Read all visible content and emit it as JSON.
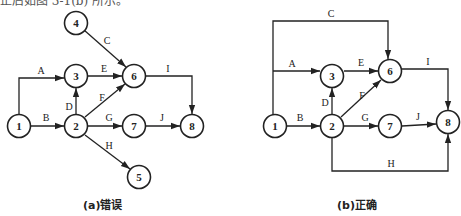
{
  "top_text": "正后如图 3-1(b) 所示。",
  "diagrams": [
    {
      "caption": "(a)错误",
      "nodes": [
        {
          "id": "1",
          "label": "1"
        },
        {
          "id": "2",
          "label": "2"
        },
        {
          "id": "3",
          "label": "3"
        },
        {
          "id": "4",
          "label": "4"
        },
        {
          "id": "5",
          "label": "5"
        },
        {
          "id": "6",
          "label": "6"
        },
        {
          "id": "7",
          "label": "7"
        },
        {
          "id": "8",
          "label": "8"
        }
      ],
      "edges": [
        {
          "label": "A",
          "from": "1",
          "to": "3"
        },
        {
          "label": "B",
          "from": "1",
          "to": "2"
        },
        {
          "label": "C",
          "from": "4",
          "to": "6"
        },
        {
          "label": "D",
          "from": "2",
          "to": "3"
        },
        {
          "label": "E",
          "from": "3",
          "to": "6"
        },
        {
          "label": "F",
          "from": "2",
          "to": "6"
        },
        {
          "label": "G",
          "from": "2",
          "to": "7"
        },
        {
          "label": "H",
          "from": "2",
          "to": "5"
        },
        {
          "label": "I",
          "from": "6",
          "to": "8"
        },
        {
          "label": "J",
          "from": "7",
          "to": "8"
        }
      ]
    },
    {
      "caption": "(b)正确",
      "nodes": [
        {
          "id": "1",
          "label": "1"
        },
        {
          "id": "2",
          "label": "2"
        },
        {
          "id": "3",
          "label": "3"
        },
        {
          "id": "6",
          "label": "6"
        },
        {
          "id": "7",
          "label": "7"
        },
        {
          "id": "8",
          "label": "8"
        }
      ],
      "edges": [
        {
          "label": "A",
          "from": "1",
          "to": "3"
        },
        {
          "label": "B",
          "from": "1",
          "to": "2"
        },
        {
          "label": "C",
          "from": "1",
          "to": "6"
        },
        {
          "label": "D",
          "from": "2",
          "to": "3"
        },
        {
          "label": "E",
          "from": "3",
          "to": "6"
        },
        {
          "label": "F",
          "from": "2",
          "to": "6"
        },
        {
          "label": "G",
          "from": "2",
          "to": "7"
        },
        {
          "label": "H",
          "from": "2",
          "to": "8"
        },
        {
          "label": "I",
          "from": "6",
          "to": "8"
        },
        {
          "label": "J",
          "from": "7",
          "to": "8"
        }
      ]
    }
  ]
}
